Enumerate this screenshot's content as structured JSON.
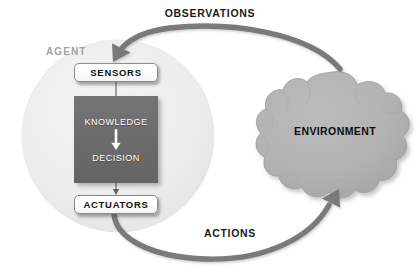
{
  "diagram": {
    "type": "block-diagram",
    "background_color": "#ffffff"
  },
  "agent": {
    "label": "AGENT",
    "label_color": "#a3a3a3",
    "circle_color": "#ececec",
    "components": {
      "sensors": {
        "label": "SENSORS"
      },
      "actuators": {
        "label": "ACTUATORS"
      },
      "processor": {
        "knowledge_label": "KNOWLEDGE",
        "decision_label": "DECISION",
        "box_color": "#6c6c6c",
        "text_color": "#ffffff",
        "internal_arrow": "down-arrow-icon"
      }
    }
  },
  "environment": {
    "label": "ENVIRONMENT",
    "shape": "cloud",
    "fill_color": "#b0b0b0",
    "text_color": "#0d0d0d"
  },
  "flows": {
    "observations": {
      "label": "OBSERVATIONS",
      "from": "ENVIRONMENT",
      "to": "SENSORS",
      "direction": "right-to-left",
      "arrow_color": "#7a7a7a"
    },
    "actions": {
      "label": "ACTIONS",
      "from": "ACTUATORS",
      "to": "ENVIRONMENT",
      "direction": "left-to-right",
      "arrow_color": "#7a7a7a"
    }
  }
}
